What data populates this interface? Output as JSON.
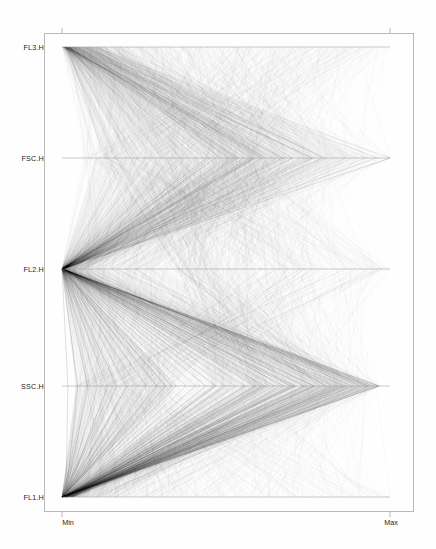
{
  "figure": {
    "type": "parallel-coordinates",
    "background": "#ffffff",
    "line_color": "#303030",
    "frame_color": "#b9b9b9",
    "axis_color": "#7a7a7a"
  },
  "axes_labels": {
    "fl3": "FL3.H",
    "fsc": "FSC.H",
    "fl2": "FL2.H",
    "ssc": "SSC.H",
    "fl1": "FL1.H"
  },
  "tick_labels": {
    "min": "Min",
    "max": "Max"
  },
  "chart_data": {
    "type": "line",
    "title": "",
    "xlabel": "",
    "ylabel": "",
    "orientation": "horizontal-parallel-axes",
    "grid": false,
    "legend": null,
    "xlim": [
      0,
      1
    ],
    "x_tick_values": [
      0,
      1
    ],
    "x_tick_labels": [
      "Min",
      "Max"
    ],
    "axis_names": [
      "FL3.H",
      "FSC.H",
      "FL2.H",
      "SSC.H",
      "FL1.H"
    ],
    "axis_y_fractions": [
      0.0,
      0.25,
      0.5,
      0.75,
      1.0
    ],
    "n_lines": 1400,
    "series": [
      {
        "name": "FL3.H",
        "anchor_min": 0.0,
        "anchor_max": 1.0,
        "density_peak": 0.05,
        "spread": 0.9
      },
      {
        "name": "FSC.H",
        "anchor_min": 0.0,
        "anchor_max": 1.0,
        "density_peak": 0.12,
        "spread": 0.95
      },
      {
        "name": "FL2.H",
        "anchor_min": 0.0,
        "anchor_max": 1.0,
        "density_peak": 0.02,
        "spread": 0.98
      },
      {
        "name": "SSC.H",
        "anchor_min": 0.0,
        "anchor_max": 1.0,
        "density_peak": 0.3,
        "spread": 0.92
      },
      {
        "name": "FL1.H",
        "anchor_min": 0.0,
        "anchor_max": 1.0,
        "density_peak": 0.01,
        "spread": 0.99
      }
    ]
  }
}
